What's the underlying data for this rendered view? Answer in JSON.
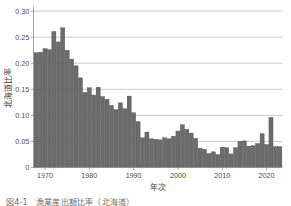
{
  "figure": {
    "caption": "図4-1　漁業産出額比率（北海道）"
  },
  "chart_data": {
    "type": "bar",
    "title": "",
    "subtitle": "",
    "xlabel": "年次",
    "ylabel": "北海道比率",
    "xlim": [
      1967.4,
      2023.6
    ],
    "ylim": [
      0,
      0.305
    ],
    "grid": "horizontal",
    "legend": null,
    "bar_color": "#6b6b6b",
    "bar_edge_color": "#4a4a4a",
    "grid_color": "#b4b4b4",
    "axis_color": "#8c8c8c",
    "background": "#ffffff",
    "xticks": [
      1970,
      1980,
      1990,
      2000,
      2010,
      2020
    ],
    "xtick_labels": [
      "1970",
      "1980",
      "1990",
      "2000",
      "2010",
      "2020"
    ],
    "yticks": [
      0,
      0.05,
      0.1,
      0.15,
      0.2,
      0.25,
      0.3
    ],
    "ytick_labels": [
      "0",
      "0.05",
      "0.10",
      "0.15",
      "0.20",
      "0.25",
      "0.30"
    ],
    "categories": [
      1968,
      1969,
      1970,
      1971,
      1972,
      1973,
      1974,
      1975,
      1976,
      1977,
      1978,
      1979,
      1980,
      1981,
      1982,
      1983,
      1984,
      1985,
      1986,
      1987,
      1988,
      1989,
      1990,
      1991,
      1992,
      1993,
      1994,
      1995,
      1996,
      1997,
      1998,
      1999,
      2000,
      2001,
      2002,
      2003,
      2004,
      2005,
      2006,
      2007,
      2008,
      2009,
      2010,
      2011,
      2012,
      2013,
      2014,
      2015,
      2016,
      2017,
      2018,
      2019,
      2020,
      2021,
      2022,
      2023
    ],
    "values": [
      0.22,
      0.221,
      0.228,
      0.226,
      0.261,
      0.241,
      0.268,
      0.225,
      0.208,
      0.195,
      0.172,
      0.144,
      0.153,
      0.139,
      0.154,
      0.136,
      0.131,
      0.119,
      0.111,
      0.124,
      0.113,
      0.137,
      0.105,
      0.088,
      0.057,
      0.068,
      0.055,
      0.054,
      0.053,
      0.057,
      0.055,
      0.06,
      0.07,
      0.082,
      0.073,
      0.066,
      0.056,
      0.037,
      0.035,
      0.027,
      0.03,
      0.025,
      0.039,
      0.038,
      0.026,
      0.038,
      0.05,
      0.051,
      0.041,
      0.042,
      0.046,
      0.065,
      0.044,
      0.096,
      0.04,
      0.04
    ]
  }
}
